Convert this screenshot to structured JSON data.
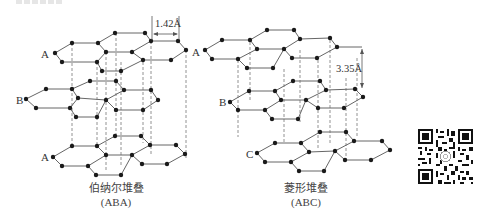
{
  "figure": {
    "panels": [
      {
        "id": "aba",
        "caption_cn": "伯纳尔堆叠",
        "caption_en": "(ABA)",
        "layer_labels": {
          "top_left": "A",
          "top_right": "A",
          "middle": "B",
          "bottom": "A"
        },
        "dimension": {
          "label": "1.42Å",
          "meaning": "C–C bond length"
        }
      },
      {
        "id": "abc",
        "caption_cn": "菱形堆叠",
        "caption_en": "(ABC)",
        "layer_labels": {
          "middle": "B",
          "bottom": "C"
        },
        "dimension": {
          "label": "3.35Å",
          "meaning": "interlayer spacing"
        }
      }
    ],
    "qr_code": {
      "present": true
    }
  }
}
